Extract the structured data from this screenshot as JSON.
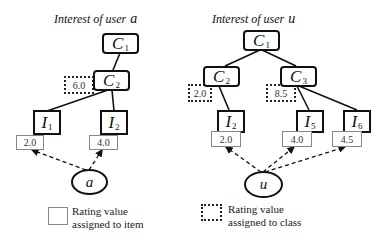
{
  "left_tree": {
    "title": "Interest of user",
    "user": "a",
    "nodes": {
      "c1": {
        "label": "C",
        "sub": "1"
      },
      "c2": {
        "label": "C",
        "sub": "2",
        "class_rating": "6.0"
      },
      "i1": {
        "label": "I",
        "sub": "1",
        "rating": "2.0"
      },
      "i2": {
        "label": "I",
        "sub": "2",
        "rating": "4.0"
      }
    }
  },
  "right_tree": {
    "title": "Interest of user",
    "user": "u",
    "nodes": {
      "c1": {
        "label": "C",
        "sub": "1"
      },
      "c2": {
        "label": "C",
        "sub": "2",
        "class_rating": "2.0"
      },
      "c3": {
        "label": "C",
        "sub": "3",
        "class_rating": "8.5"
      },
      "i2": {
        "label": "I",
        "sub": "2",
        "rating": "2.0"
      },
      "i5": {
        "label": "I",
        "sub": "5",
        "rating": "4.0"
      },
      "i6": {
        "label": "I",
        "sub": "6",
        "rating": "4.5"
      }
    }
  },
  "legend": {
    "item_rating": {
      "line1": "Rating value",
      "line2": "assigned to item"
    },
    "class_rating": {
      "line1": "Rating value",
      "line2": "assigned to class"
    }
  }
}
